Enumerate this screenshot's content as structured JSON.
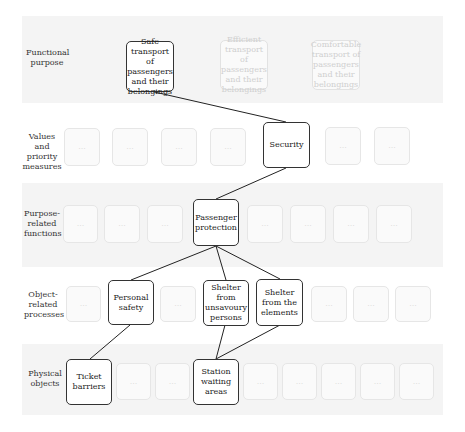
{
  "levels": [
    {
      "label": "Functional purpose"
    },
    {
      "label": "Values and priority measures"
    },
    {
      "label": "Purpose-related functions"
    },
    {
      "label": "Object-related processes"
    },
    {
      "label": "Physical objects"
    }
  ],
  "nodes": {
    "safe_transport": "Safe transport of passengers and their belongings",
    "efficient_transport": "Efficient transport of passengers and their belongings",
    "comfortable_transport": "Comfortable transport of passengers and their belongings",
    "security": "Security",
    "passenger_protection": "Passenger protection",
    "personal_safety": "Personal safety",
    "shelter_unsavoury": "Shelter from unsavoury persons",
    "shelter_elements": "Shelter from the elements",
    "ticket_barriers": "Ticket barriers",
    "station_waiting": "Station waiting areas"
  },
  "placeholder": "...",
  "edges": [
    [
      "safe_transport",
      "security"
    ],
    [
      "security",
      "passenger_protection"
    ],
    [
      "passenger_protection",
      "personal_safety"
    ],
    [
      "passenger_protection",
      "shelter_unsavoury"
    ],
    [
      "passenger_protection",
      "shelter_elements"
    ],
    [
      "personal_safety",
      "ticket_barriers"
    ],
    [
      "shelter_unsavoury",
      "station_waiting"
    ],
    [
      "shelter_elements",
      "station_waiting"
    ]
  ]
}
